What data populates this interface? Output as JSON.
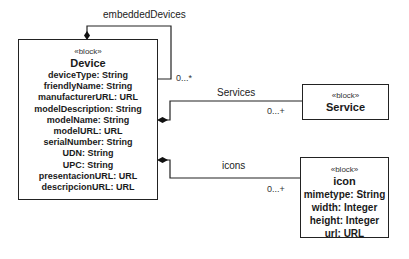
{
  "blocks": {
    "device": {
      "stereotype": "«block»",
      "name": "Device",
      "attributes": [
        "deviceType: String",
        "friendlyName: String",
        "manufacturerURL: URL",
        "modelDescription: String",
        "modelName: String",
        "modelURL: URL",
        "serialNumber: String",
        "UDN: String",
        "UPC: String",
        "presentacionURL: URL",
        "descripcionURL: URL"
      ]
    },
    "service": {
      "stereotype": "«block»",
      "name": "Service"
    },
    "icon": {
      "stereotype": "«block»",
      "name": "icon",
      "attributes": [
        "mimetype: String",
        "width: Integer",
        "height: Integer",
        "url: URL"
      ]
    }
  },
  "associations": {
    "embedded": {
      "label": "embeddedDevices",
      "multiplicity": "0...*"
    },
    "services": {
      "label": "Services",
      "multiplicity": "0...+"
    },
    "icons": {
      "label": "icons",
      "multiplicity": "0...+"
    }
  }
}
